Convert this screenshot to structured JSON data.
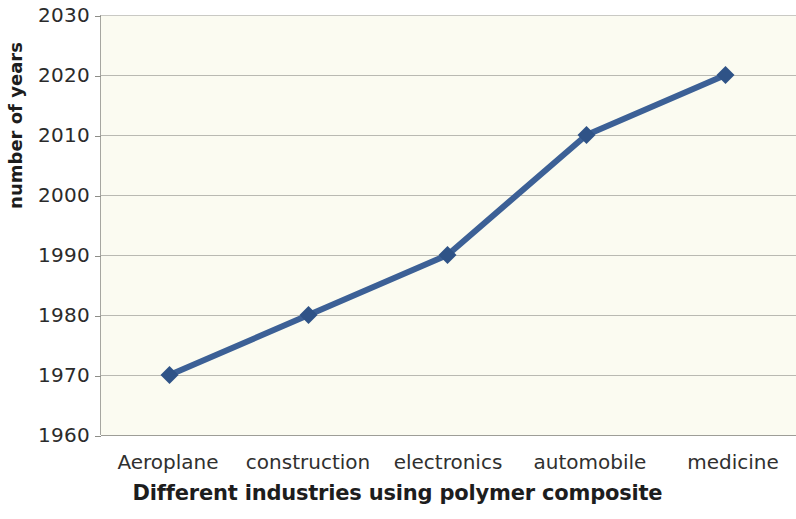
{
  "chart_data": {
    "type": "line",
    "title": "",
    "xlabel": "Different industries using polymer composite",
    "ylabel": "number of years",
    "categories": [
      "Aeroplane",
      "construction",
      "electronics",
      "automobile",
      "medicine"
    ],
    "values": [
      1970,
      1980,
      1990,
      2010,
      2020
    ],
    "series": [
      {
        "name": "number of years",
        "values": [
          1970,
          1980,
          1990,
          2010,
          2020
        ]
      }
    ],
    "ylim": [
      1960,
      2030
    ],
    "ytick_labels": [
      "2030",
      "2020",
      "2010",
      "2000",
      "1990",
      "1980",
      "1970",
      "1960"
    ],
    "ytick_values": [
      2030,
      2020,
      2010,
      2000,
      1990,
      1980,
      1970,
      1960
    ],
    "ytick_step": 10,
    "grid": "horizontal",
    "legend": "none",
    "marker": "diamond",
    "colors": {
      "line": "#3c6096",
      "marker": "#2f5387",
      "gridline": "#b9b9b2",
      "axis": "#9d9d97",
      "plot_background": "#fbfbf1",
      "page_background": "#ffffff",
      "text": "#2b2b2b"
    }
  },
  "axis": {
    "y_title": "number of years",
    "x_title": "Different industries using polymer composite"
  }
}
